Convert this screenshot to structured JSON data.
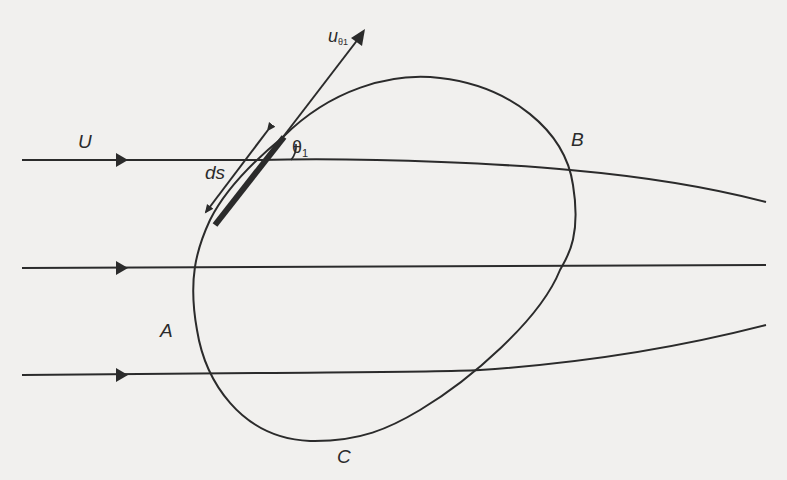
{
  "figure": {
    "labels": {
      "free_stream_velocity": "U",
      "element_length": "ds",
      "angle": "θ",
      "angle_subscript": "1",
      "tangential_velocity": "u",
      "tangential_velocity_subscript_theta": "θ",
      "tangential_velocity_subscript_index": "1",
      "point_a": "A",
      "point_b": "B",
      "point_c": "C"
    },
    "colors": {
      "line": "#2b2b2b",
      "background": "#f1f0ee"
    }
  }
}
